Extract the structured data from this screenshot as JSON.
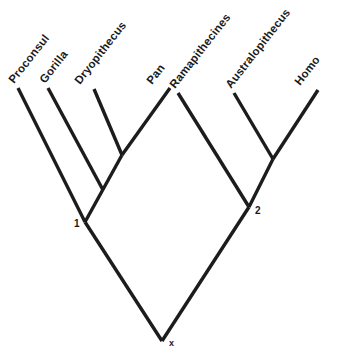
{
  "diagram": {
    "background_color": "#ffffff",
    "line_color": "#1c1c1c",
    "text_color": "#1a1a1a"
  },
  "chart_data": {
    "type": "diagram",
    "subtype": "cladogram",
    "title": "",
    "taxa": [
      {
        "label": "Proconsul",
        "tip_x": 18,
        "tip_y": 88,
        "label_x": 14,
        "label_y": 84,
        "rotation": -52
      },
      {
        "label": "Gorilla",
        "tip_x": 48,
        "tip_y": 88,
        "label_x": 45,
        "label_y": 84,
        "rotation": -52
      },
      {
        "label": "Dryopithecus",
        "tip_x": 94,
        "tip_y": 89,
        "label_x": 80,
        "label_y": 85,
        "rotation": -52
      },
      {
        "label": "Pan",
        "tip_x": 170,
        "tip_y": 88,
        "label_x": 152,
        "label_y": 85,
        "rotation": -52
      },
      {
        "label": "Ramapithecines",
        "tip_x": 178,
        "tip_y": 93,
        "label_x": 175,
        "label_y": 89,
        "rotation": -52
      },
      {
        "label": "Australopithecus",
        "tip_x": 234,
        "tip_y": 93,
        "label_x": 231,
        "label_y": 89,
        "rotation": -52
      },
      {
        "label": "Homo",
        "tip_x": 318,
        "tip_y": 90,
        "label_x": 300,
        "label_y": 86,
        "rotation": -52
      }
    ],
    "nodes": [
      {
        "label": "1",
        "x": 85,
        "y": 222,
        "label_x": 74,
        "label_y": 227
      },
      {
        "label": "2",
        "x": 249,
        "y": 207,
        "label_x": 255,
        "label_y": 214
      },
      {
        "label": "x",
        "x": 162,
        "y": 341,
        "label_x": 169,
        "label_y": 346
      }
    ],
    "branches": [
      {
        "name": "proconsul-branch",
        "x1": 18,
        "y1": 88,
        "x2": 85,
        "y2": 222
      },
      {
        "name": "gorilla-branch",
        "x1": 48,
        "y1": 88,
        "x2": 103,
        "y2": 190
      },
      {
        "name": "dryopithecus-branch",
        "x1": 94,
        "y1": 89,
        "x2": 122,
        "y2": 155
      },
      {
        "name": "pan-branch",
        "x1": 170,
        "y1": 88,
        "x2": 122,
        "y2": 155
      },
      {
        "name": "dryo-pan-stem",
        "x1": 122,
        "y1": 155,
        "x2": 85,
        "y2": 222
      },
      {
        "name": "ramapithecines-branch",
        "x1": 178,
        "y1": 93,
        "x2": 249,
        "y2": 207
      },
      {
        "name": "australopithecus-branch",
        "x1": 234,
        "y1": 93,
        "x2": 273,
        "y2": 159
      },
      {
        "name": "homo-branch",
        "x1": 318,
        "y1": 90,
        "x2": 273,
        "y2": 159
      },
      {
        "name": "austra-homo-stem",
        "x1": 273,
        "y1": 159,
        "x2": 249,
        "y2": 207
      },
      {
        "name": "left-root-branch",
        "x1": 85,
        "y1": 222,
        "x2": 162,
        "y2": 341
      },
      {
        "name": "right-root-branch",
        "x1": 249,
        "y1": 207,
        "x2": 162,
        "y2": 341
      }
    ]
  }
}
